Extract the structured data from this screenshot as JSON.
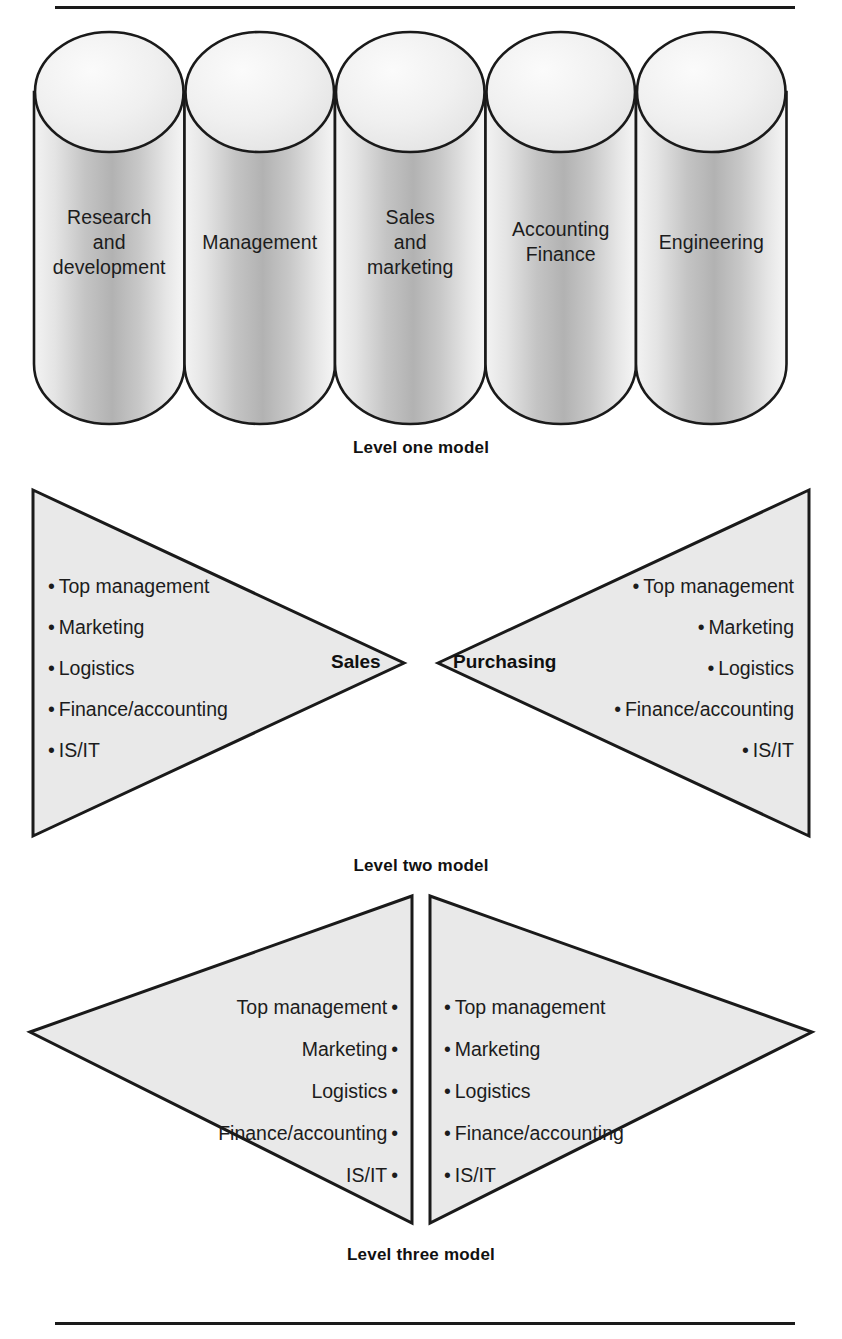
{
  "document": {
    "has_top_rule": true,
    "has_bottom_rule": true,
    "ink_color": "#1a1a1a",
    "fill_color": "#e9e9e9"
  },
  "level_one": {
    "caption": "Level one model",
    "cylinders": [
      {
        "label": "Research\nand\ndevelopment",
        "lines": [
          "Research",
          "and",
          "development"
        ]
      },
      {
        "label": "Management",
        "lines": [
          "Management"
        ]
      },
      {
        "label": "Sales\nand\nmarketing",
        "lines": [
          "Sales",
          "and",
          "marketing"
        ]
      },
      {
        "label": "Accounting\nFinance",
        "lines": [
          "Accounting",
          "Finance"
        ]
      },
      {
        "label": "Engineering",
        "lines": [
          "Engineering"
        ]
      }
    ]
  },
  "level_two": {
    "caption": "Level two model",
    "left": {
      "apex_label": "Sales",
      "bullet_char": "•",
      "items": [
        "Top management",
        "Marketing",
        "Logistics",
        "Finance/accounting",
        "IS/IT"
      ]
    },
    "right": {
      "apex_label": "Purchasing",
      "bullet_char": "•",
      "items": [
        "Top management",
        "Marketing",
        "Logistics",
        "Finance/accounting",
        "IS/IT"
      ]
    }
  },
  "level_three": {
    "caption": "Level three model",
    "left": {
      "bullet_char": "•",
      "bullet_position": "after",
      "items": [
        "Top management",
        "Marketing",
        "Logistics",
        "Finance/accounting",
        "IS/IT"
      ]
    },
    "right": {
      "bullet_char": "•",
      "bullet_position": "before",
      "items": [
        "Top management",
        "Marketing",
        "Logistics",
        "Finance/accounting",
        "IS/IT"
      ]
    }
  }
}
